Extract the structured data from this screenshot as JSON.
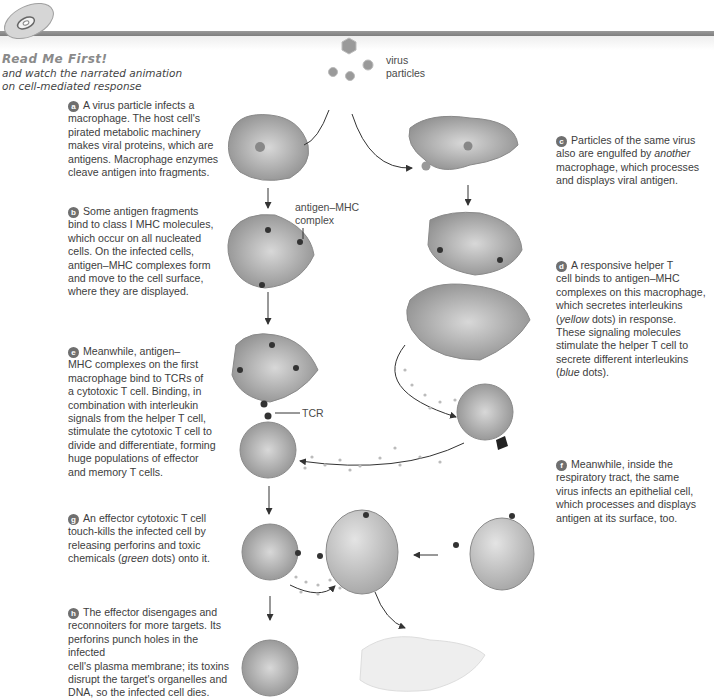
{
  "header": {
    "title": "Read Me First!",
    "subtitle_lines": [
      "and watch the narrated animation",
      "on cell-mediated response"
    ],
    "icon": "cd-disc-icon"
  },
  "steps": [
    {
      "letter": "a",
      "lines": [
        "A virus particle infects a",
        "macrophage. The host cell's",
        "pirated metabolic machinery",
        "makes viral proteins, which are",
        "antigens. Macrophage enzymes",
        "cleave antigen into fragments."
      ]
    },
    {
      "letter": "b",
      "lines": [
        "Some antigen fragments",
        "bind to class I MHC molecules,",
        "which occur on all nucleated",
        "cells. On the infected cells,",
        "antigen–MHC complexes form",
        "and move to the cell surface,",
        "where they are displayed."
      ]
    },
    {
      "letter": "c",
      "lines": [
        "Particles of the same virus",
        "also are engulfed by another",
        "macrophage, which processes",
        "and displays viral antigen."
      ],
      "emphasis": "another"
    },
    {
      "letter": "d",
      "lines": [
        "A responsive helper T",
        "cell binds to antigen–MHC",
        "complexes on this macrophage,",
        "which secretes interleukins",
        "(yellow dots) in response.",
        "These signaling molecules",
        "stimulate the helper T cell to",
        "secrete different interleukins",
        "(blue dots)."
      ],
      "emphasis": [
        "yellow",
        "blue"
      ]
    },
    {
      "letter": "e",
      "lines": [
        "Meanwhile, antigen–",
        "MHC complexes on the first",
        "macrophage bind to TCRs of",
        "a cytotoxic T cell. Binding, in",
        "combination with interleukin",
        "signals from the helper T cell,",
        "stimulate the cytotoxic T cell to",
        "divide and differentiate, forming",
        "huge populations of effector",
        "and memory T cells."
      ]
    },
    {
      "letter": "f",
      "lines": [
        "Meanwhile, inside the",
        "respiratory tract, the same",
        "virus infects an epithelial cell,",
        "which processes and displays",
        "antigen at its surface, too."
      ]
    },
    {
      "letter": "g",
      "lines": [
        "An effector cytotoxic T cell",
        "touch-kills the infected cell by",
        "releasing perforins and toxic",
        "chemicals (green dots) onto it."
      ],
      "emphasis": "green"
    },
    {
      "letter": "h",
      "lines": [
        "The effector disengages and",
        "reconnoiters for more targets. Its",
        "perforins punch holes in the infected",
        "cell's plasma membrane; its toxins",
        "disrupt the target's organelles and",
        "DNA, so the infected cell dies."
      ]
    }
  ],
  "diagram_labels": {
    "virus_particles": [
      "virus",
      "particles"
    ],
    "antigen_mhc": [
      "antigen–MHC",
      "complex"
    ],
    "tcr": "TCR"
  },
  "colors": {
    "badge": "#6f6f6f",
    "header_bar": "#8a8a8a",
    "cell_fill": "#a8a8a8",
    "text": "#3d3d3d"
  }
}
